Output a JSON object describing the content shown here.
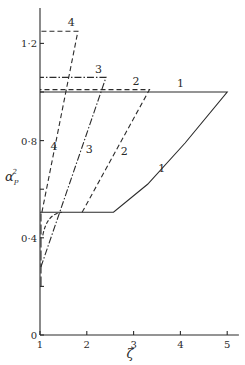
{
  "chart_data": {
    "type": "line",
    "title": "",
    "xlabel": "ζ",
    "ylabel": "α_P²",
    "xlim": [
      1,
      5.2
    ],
    "ylim": [
      0,
      1.33
    ],
    "grid": false,
    "legend": "none (curves labelled inline 1–4)",
    "x_ticks": [
      1,
      2,
      3,
      4,
      5
    ],
    "x_tick_labels": [
      "1",
      "2",
      "3",
      "4",
      "5"
    ],
    "y_ticks": [
      0,
      0.2,
      0.4,
      0.6,
      0.8,
      1.0,
      1.2
    ],
    "y_tick_labels": [
      "0",
      "",
      "0·4",
      "",
      "0·8",
      "",
      "1·2"
    ],
    "series": [
      {
        "name": "1",
        "style": "solid",
        "points": [
          [
            1.0,
            0.505
          ],
          [
            2.57,
            0.505
          ],
          [
            3.3,
            0.62
          ],
          [
            4.1,
            0.79
          ],
          [
            5.0,
            1.0
          ],
          [
            1.0,
            1.0
          ]
        ],
        "label_positions": [
          [
            4.0,
            1.02
          ],
          [
            3.6,
            0.67
          ]
        ]
      },
      {
        "name": "2",
        "style": "dashed",
        "points": [
          [
            1.9,
            0.505
          ],
          [
            3.34,
            1.01
          ],
          [
            1.0,
            1.01
          ]
        ],
        "label_positions": [
          [
            3.05,
            1.03
          ],
          [
            2.8,
            0.74
          ]
        ]
      },
      {
        "name": "3",
        "style": "dash-dot",
        "points": [
          [
            1.02,
            0.28
          ],
          [
            2.41,
            1.06
          ],
          [
            1.0,
            1.06
          ]
        ],
        "label_positions": [
          [
            2.25,
            1.08
          ],
          [
            2.05,
            0.75
          ]
        ]
      },
      {
        "name": "4",
        "style": "dashed",
        "points": [
          [
            1.04,
            0.505
          ],
          [
            1.81,
            1.25
          ],
          [
            1.0,
            1.25
          ]
        ],
        "extra_segment": [
          [
            1.06,
            0.41
          ],
          [
            1.12,
            0.47
          ],
          [
            1.25,
            0.5
          ],
          [
            1.47,
            0.505
          ]
        ],
        "label_positions": [
          [
            1.67,
            1.27
          ],
          [
            1.3,
            0.76
          ]
        ]
      }
    ],
    "axis_dashed_segment": [
      [
        1.0,
        0.2
      ],
      [
        1.0,
        0.5
      ]
    ]
  }
}
